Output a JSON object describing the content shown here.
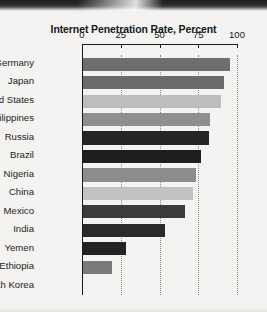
{
  "chart_data": {
    "type": "bar",
    "orientation": "horizontal",
    "title": "Internet Penetration Rate, Percent",
    "xlabel": "",
    "ylabel": "",
    "xlim": [
      0,
      100
    ],
    "xticks": [
      "0",
      "25",
      "50",
      "75",
      "100"
    ],
    "xtick_values": [
      0,
      25,
      50,
      75,
      100
    ],
    "grid": "vertical dotted gridlines at 25, 50, 75, 100",
    "legend": "none",
    "categories": [
      "Germany",
      "Japan",
      "United States",
      "Philippines",
      "Russia",
      "Brazil",
      "Nigeria",
      "China",
      "Mexico",
      "India",
      "Yemen",
      "Ethiopia",
      "North Korea"
    ],
    "values": [
      95,
      91,
      89,
      82,
      81,
      76,
      73,
      71,
      66,
      53,
      28,
      19,
      0
    ],
    "bar_colors": [
      "#6e6e6e",
      "#6b6b6b",
      "#bdbdbd",
      "#8e8e8e",
      "#252525",
      "#1e1e1e",
      "#8c8c8c",
      "#c2c2c2",
      "#3b3b3b",
      "#2a2a2a",
      "#232323",
      "#7a7a7a",
      "#7a7a7a"
    ]
  },
  "colors": {
    "background": "#f4f3f1",
    "axis": "#1a1a1a",
    "gridline": "#8f8c86",
    "text": "#15181b"
  }
}
